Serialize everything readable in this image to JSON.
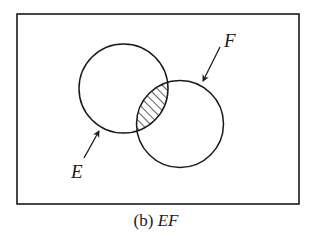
{
  "figure": {
    "caption_prefix": "(b) ",
    "caption_expr": "EF",
    "universe": {
      "x": 17,
      "y": 14,
      "width": 282,
      "height": 190
    },
    "sets": [
      {
        "name": "E",
        "label": "E",
        "cx": 123.5,
        "cy": 88.5,
        "r": 44.5,
        "label_pos": {
          "x": 71,
          "y": 178
        },
        "arrow": {
          "x1": 84,
          "y1": 158,
          "x2": 99,
          "y2": 131
        }
      },
      {
        "name": "F",
        "label": "F",
        "cx": 180,
        "cy": 124,
        "r": 43.5,
        "label_pos": {
          "x": 224,
          "y": 47
        },
        "arrow": {
          "x1": 220,
          "y1": 47,
          "x2": 203,
          "y2": 81
        }
      }
    ],
    "shaded_region": "intersection",
    "colors": {
      "stroke": "#1a1a1a",
      "background": "#ffffff"
    }
  }
}
